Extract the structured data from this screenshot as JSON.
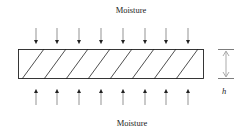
{
  "diagram": {
    "top_label": "Moisture",
    "bottom_label": "Moisture",
    "dimension_label": "h",
    "arrow_count_top": 8,
    "arrow_count_bottom": 8,
    "hatch_count": 8,
    "colors": {
      "stroke": "#222222",
      "arrow": "#555555",
      "background": "#ffffff"
    }
  }
}
